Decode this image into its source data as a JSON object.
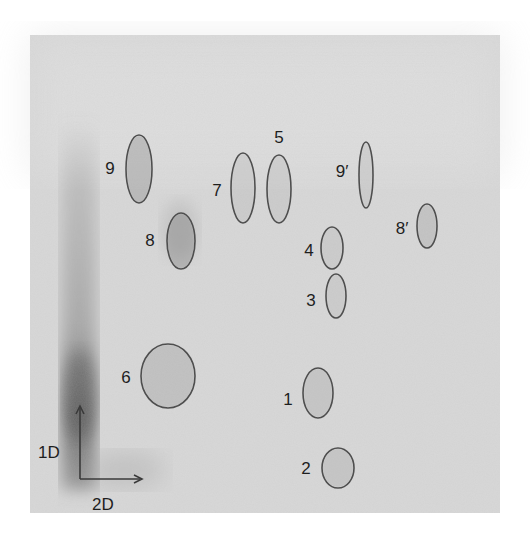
{
  "figure": {
    "type": "2D thin-layer chromatography autoradiograph",
    "plate": {
      "x": 30,
      "y": 35,
      "width": 470,
      "height": 478,
      "color": "#d9d9d9"
    },
    "axes": {
      "first_dimension": {
        "label": "1D",
        "direction": "up"
      },
      "second_dimension": {
        "label": "2D",
        "direction": "right"
      }
    },
    "spots": [
      {
        "id": "1",
        "label": "1",
        "cx": 318,
        "cy": 393,
        "rx": 15,
        "ry": 25,
        "label_x": 288,
        "label_y": 405,
        "shade": 0.16
      },
      {
        "id": "2",
        "label": "2",
        "cx": 338,
        "cy": 468,
        "rx": 16,
        "ry": 20,
        "label_x": 306,
        "label_y": 474,
        "shade": 0.16
      },
      {
        "id": "3",
        "label": "3",
        "cx": 336,
        "cy": 296,
        "rx": 10,
        "ry": 22,
        "label_x": 311,
        "label_y": 306,
        "shade": 0.1
      },
      {
        "id": "4",
        "label": "4",
        "cx": 332,
        "cy": 248,
        "rx": 11,
        "ry": 21,
        "label_x": 309,
        "label_y": 256,
        "shade": 0.1
      },
      {
        "id": "5",
        "label": "5",
        "cx": 279,
        "cy": 189,
        "rx": 12,
        "ry": 34,
        "label_x": 279,
        "label_y": 143,
        "shade": 0.1
      },
      {
        "id": "6",
        "label": "6",
        "cx": 168,
        "cy": 376,
        "rx": 27,
        "ry": 32,
        "label_x": 126,
        "label_y": 383,
        "shade": 0.2
      },
      {
        "id": "7",
        "label": "7",
        "cx": 243,
        "cy": 188,
        "rx": 12,
        "ry": 35,
        "label_x": 217,
        "label_y": 196,
        "shade": 0.1
      },
      {
        "id": "8",
        "label": "8",
        "cx": 181,
        "cy": 241,
        "rx": 14,
        "ry": 28,
        "label_x": 150,
        "label_y": 246,
        "shade": 0.32
      },
      {
        "id": "9",
        "label": "9",
        "cx": 139,
        "cy": 169,
        "rx": 13,
        "ry": 34,
        "label_x": 110,
        "label_y": 174,
        "shade": 0.28
      },
      {
        "id": "8p",
        "label": "8′",
        "cx": 427,
        "cy": 226,
        "rx": 10,
        "ry": 22,
        "label_x": 402,
        "label_y": 234,
        "shade": 0.18
      },
      {
        "id": "9p",
        "label": "9′",
        "cx": 366,
        "cy": 175,
        "rx": 7,
        "ry": 33,
        "label_x": 342,
        "label_y": 177,
        "shade": 0.1
      }
    ]
  }
}
